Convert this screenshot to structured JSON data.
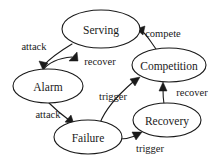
{
  "diagram": {
    "type": "state-transition-graph",
    "background_color": "#ffffff",
    "stroke_color": "#1a1a1a",
    "nodes": [
      {
        "id": "serving",
        "label": "Serving",
        "cx": 101,
        "cy": 29,
        "rx": 39,
        "ry": 19
      },
      {
        "id": "alarm",
        "label": "Alarm",
        "cx": 48,
        "cy": 86,
        "rx": 35,
        "ry": 17
      },
      {
        "id": "competition",
        "label": "Competition",
        "cx": 169,
        "cy": 65,
        "rx": 37,
        "ry": 17
      },
      {
        "id": "failure",
        "label": "Failure",
        "cx": 88,
        "cy": 137,
        "rx": 34,
        "ry": 17
      },
      {
        "id": "recovery",
        "label": "Recovery",
        "cx": 167,
        "cy": 120,
        "rx": 34,
        "ry": 17
      }
    ],
    "edges": [
      {
        "id": "serving-alarm",
        "from": "Serving",
        "to": "Alarm",
        "label": "attack",
        "label_x": 34,
        "label_y": 46
      },
      {
        "id": "alarm-serving",
        "from": "Alarm",
        "to": "Serving",
        "label": "recover",
        "label_x": 100,
        "label_y": 61
      },
      {
        "id": "competition-serving",
        "from": "Competition",
        "to": "Serving",
        "label": "compete",
        "label_x": 163,
        "label_y": 33
      },
      {
        "id": "alarm-failure",
        "from": "Alarm",
        "to": "Failure",
        "label": "attack",
        "label_x": 48,
        "label_y": 114
      },
      {
        "id": "failure-competition",
        "from": "Failure",
        "to": "Competition",
        "label": "trigger",
        "label_x": 113,
        "label_y": 96
      },
      {
        "id": "recovery-competition",
        "from": "Recovery",
        "to": "Competition",
        "label": "recover",
        "label_x": 192,
        "label_y": 92
      },
      {
        "id": "failure-recovery",
        "from": "Failure",
        "to": "Recovery",
        "label": "trigger",
        "label_x": 150,
        "label_y": 148
      }
    ]
  }
}
